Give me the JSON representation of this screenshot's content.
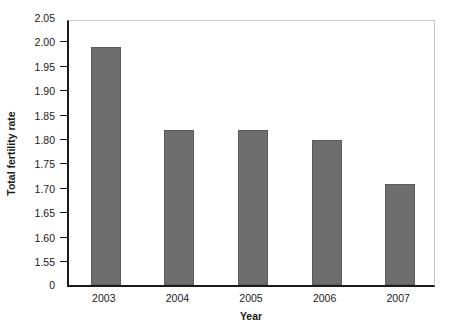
{
  "chart_data": {
    "type": "bar",
    "title": "",
    "subtitle": "",
    "xlabel": "Year",
    "ylabel": "Total fertility rate",
    "categories": [
      "2003",
      "2004",
      "2005",
      "2006",
      "2007"
    ],
    "values": [
      1.99,
      1.82,
      1.82,
      1.8,
      1.71
    ],
    "series": [
      {
        "name": "Total fertility rate",
        "values": [
          1.99,
          1.82,
          1.82,
          1.8,
          1.71
        ]
      }
    ],
    "ylim": [
      1.55,
      2.05
    ],
    "y_axis_break": true,
    "y_tick_labels": [
      "2.05",
      "2.00",
      "1.95",
      "1.90",
      "1.85",
      "1.80",
      "1.75",
      "1.70",
      "1.65",
      "1.60",
      "1.55",
      "0"
    ],
    "y_tick_values": [
      2.05,
      2.0,
      1.95,
      1.9,
      1.85,
      1.8,
      1.75,
      1.7,
      1.65,
      1.6,
      1.55,
      0
    ],
    "x_tick_labels": [
      "2003",
      "2004",
      "2005",
      "2006",
      "2007"
    ],
    "grid": false,
    "legend": false,
    "legend_position": "none",
    "bar_color": "#6e6e6e",
    "axis_color": "#1a1a1a",
    "frame_color": "#c9c9c9",
    "background_color": "#ffffff"
  }
}
